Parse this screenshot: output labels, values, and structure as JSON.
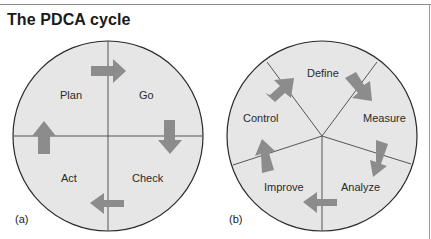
{
  "title": "The PDCA cycle",
  "colors": {
    "circle_fill": "#e6e6e6",
    "circle_stroke": "#2a2a2a",
    "arrow": "#8c8c8c",
    "divider": "#555555"
  },
  "diagram_a": {
    "tag": "(a)",
    "labels": [
      "Plan",
      "Go",
      "Check",
      "Act"
    ]
  },
  "diagram_b": {
    "tag": "(b)",
    "labels": [
      "Define",
      "Measure",
      "Analyze",
      "Improve",
      "Control"
    ]
  }
}
